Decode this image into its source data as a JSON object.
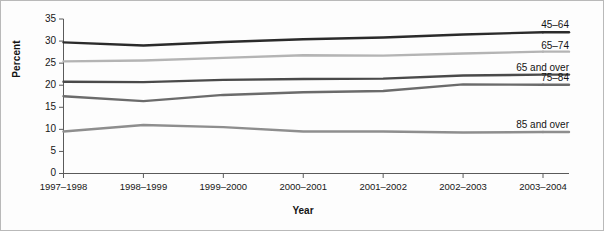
{
  "chart_data": {
    "type": "line",
    "title": "",
    "xlabel": "Year",
    "ylabel": "Percent",
    "ylim": [
      0,
      35
    ],
    "ytick_values": [
      0,
      5,
      10,
      15,
      20,
      25,
      30,
      35
    ],
    "ytick_labels": [
      "0",
      "5",
      "10",
      "15",
      "20",
      "25",
      "30",
      "35"
    ],
    "grid": false,
    "legend_position": "right-inline-labels",
    "categories": [
      "1997–1998",
      "1998–1999",
      "1999–2000",
      "2000–2001",
      "2001–2002",
      "2002–2003",
      "2003–2004"
    ],
    "series": [
      {
        "name": "45–64",
        "color": "#2b2b2b",
        "values": [
          29.7,
          29.0,
          29.8,
          30.4,
          30.8,
          31.5,
          32.0
        ]
      },
      {
        "name": "65–74",
        "color": "#b4b4b4",
        "values": [
          25.4,
          25.6,
          26.2,
          26.8,
          26.7,
          27.2,
          27.6
        ]
      },
      {
        "name": "65 and over",
        "color": "#4a4a4a",
        "values": [
          20.8,
          20.7,
          21.2,
          21.4,
          21.5,
          22.2,
          22.4
        ]
      },
      {
        "name": "75–84",
        "color": "#6b6b6b",
        "values": [
          17.5,
          16.4,
          17.8,
          18.4,
          18.7,
          20.2,
          20.1
        ]
      },
      {
        "name": "85 and over",
        "color": "#8e8e8e",
        "values": [
          9.5,
          11.0,
          10.5,
          9.5,
          9.5,
          9.3,
          9.4
        ]
      }
    ]
  },
  "axes": {
    "x_title": "Year",
    "y_title": "Percent"
  }
}
